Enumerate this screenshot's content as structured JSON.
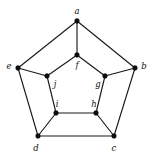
{
  "diagram": {
    "type": "undirected-graph",
    "canvas": {
      "width": 152,
      "height": 158,
      "background": "#ffffff"
    },
    "style": {
      "edge_color": "#1a1a1a",
      "edge_width": 1.15,
      "vertex_color": "#0d0d0d",
      "vertex_radius": 2.4,
      "label_color": "#111111",
      "label_font_size": 8.5
    },
    "vertices": [
      {
        "id": "a",
        "label": "a",
        "x": 77,
        "y": 21,
        "label_x": 77,
        "label_y": 11,
        "ring": "outer"
      },
      {
        "id": "b",
        "label": "b",
        "x": 135,
        "y": 68,
        "label_x": 144,
        "label_y": 66,
        "ring": "outer"
      },
      {
        "id": "c",
        "label": "c",
        "x": 114,
        "y": 136,
        "label_x": 114,
        "label_y": 148,
        "ring": "outer"
      },
      {
        "id": "d",
        "label": "d",
        "x": 38,
        "y": 136,
        "label_x": 36,
        "label_y": 148,
        "ring": "outer"
      },
      {
        "id": "e",
        "label": "e",
        "x": 18,
        "y": 68,
        "label_x": 9,
        "label_y": 66,
        "ring": "outer"
      },
      {
        "id": "f",
        "label": "f",
        "x": 77,
        "y": 55,
        "label_x": 77,
        "label_y": 65,
        "ring": "inner"
      },
      {
        "id": "g",
        "label": "g",
        "x": 105,
        "y": 76,
        "label_x": 98,
        "label_y": 84,
        "ring": "inner"
      },
      {
        "id": "h",
        "label": "h",
        "x": 96,
        "y": 113,
        "label_x": 94,
        "label_y": 104,
        "ring": "inner"
      },
      {
        "id": "i",
        "label": "i",
        "x": 56,
        "y": 113,
        "label_x": 57,
        "label_y": 104,
        "ring": "inner"
      },
      {
        "id": "j",
        "label": "j",
        "x": 47,
        "y": 76,
        "label_x": 55,
        "label_y": 84,
        "ring": "inner"
      }
    ],
    "edges": [
      {
        "from": "a",
        "to": "b",
        "kind": "outer-cycle"
      },
      {
        "from": "b",
        "to": "c",
        "kind": "outer-cycle"
      },
      {
        "from": "c",
        "to": "d",
        "kind": "outer-cycle"
      },
      {
        "from": "d",
        "to": "e",
        "kind": "outer-cycle"
      },
      {
        "from": "e",
        "to": "a",
        "kind": "outer-cycle"
      },
      {
        "from": "f",
        "to": "g",
        "kind": "inner-cycle"
      },
      {
        "from": "g",
        "to": "h",
        "kind": "inner-cycle"
      },
      {
        "from": "h",
        "to": "i",
        "kind": "inner-cycle"
      },
      {
        "from": "i",
        "to": "j",
        "kind": "inner-cycle"
      },
      {
        "from": "j",
        "to": "f",
        "kind": "inner-cycle"
      },
      {
        "from": "a",
        "to": "f",
        "kind": "spoke"
      },
      {
        "from": "b",
        "to": "g",
        "kind": "spoke"
      },
      {
        "from": "c",
        "to": "h",
        "kind": "spoke"
      },
      {
        "from": "d",
        "to": "i",
        "kind": "spoke"
      },
      {
        "from": "e",
        "to": "j",
        "kind": "spoke"
      }
    ]
  }
}
